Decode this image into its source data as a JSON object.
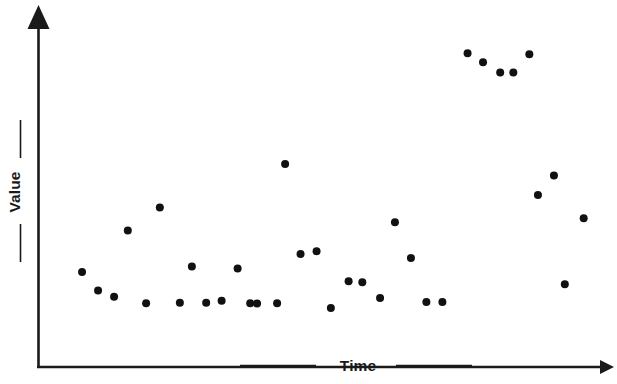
{
  "figure": {
    "background_color": "#ffffff",
    "width": 617,
    "height": 384,
    "marker_color": "#111111",
    "axis_color": "#1a1a1a"
  },
  "axes": {
    "y_label": "Value",
    "x_label": "Time",
    "y_axis_name": "value-axis",
    "x_axis_name": "time-axis",
    "y_arrow": "arrow-up-icon",
    "x_arrow": "arrow-right-icon"
  },
  "chart_data": {
    "type": "scatter",
    "title": "",
    "subtitle": "",
    "xlabel": "Time",
    "ylabel": "Value",
    "xlim": [
      0,
      100
    ],
    "ylim": [
      0,
      100
    ],
    "grid": false,
    "legend": null,
    "axis_ticks": {
      "x": [],
      "y": []
    },
    "marker_size": 8,
    "marker_shape": "circle",
    "series": [
      {
        "name": "observations",
        "color": "#111111",
        "points": [
          {
            "x": 7.7,
            "y": 27.2
          },
          {
            "x": 10.5,
            "y": 21.9
          },
          {
            "x": 13.3,
            "y": 20.1
          },
          {
            "x": 15.7,
            "y": 39.1
          },
          {
            "x": 18.9,
            "y": 18.3
          },
          {
            "x": 21.3,
            "y": 45.7
          },
          {
            "x": 24.8,
            "y": 18.4
          },
          {
            "x": 26.9,
            "y": 28.8
          },
          {
            "x": 29.4,
            "y": 18.4
          },
          {
            "x": 32.1,
            "y": 19.0
          },
          {
            "x": 34.9,
            "y": 28.2
          },
          {
            "x": 37.1,
            "y": 18.3
          },
          {
            "x": 38.3,
            "y": 18.2
          },
          {
            "x": 41.8,
            "y": 18.3
          },
          {
            "x": 43.2,
            "y": 58.2
          },
          {
            "x": 45.9,
            "y": 32.4
          },
          {
            "x": 48.7,
            "y": 33.2
          },
          {
            "x": 51.2,
            "y": 16.9
          },
          {
            "x": 54.3,
            "y": 24.6
          },
          {
            "x": 56.7,
            "y": 24.3
          },
          {
            "x": 59.8,
            "y": 19.8
          },
          {
            "x": 62.4,
            "y": 41.5
          },
          {
            "x": 65.2,
            "y": 31.2
          },
          {
            "x": 67.9,
            "y": 18.6
          },
          {
            "x": 70.7,
            "y": 18.6
          },
          {
            "x": 75.1,
            "y": 89.9
          },
          {
            "x": 77.8,
            "y": 87.3
          },
          {
            "x": 80.8,
            "y": 84.4
          },
          {
            "x": 83.1,
            "y": 84.4
          },
          {
            "x": 85.9,
            "y": 89.6
          },
          {
            "x": 87.4,
            "y": 49.3
          },
          {
            "x": 90.2,
            "y": 54.9
          },
          {
            "x": 92.1,
            "y": 23.7
          },
          {
            "x": 95.4,
            "y": 42.6
          }
        ]
      }
    ]
  }
}
